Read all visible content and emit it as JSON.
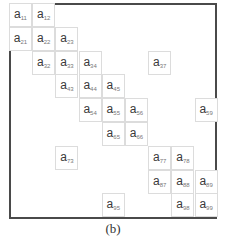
{
  "figure": {
    "caption": "(b)",
    "matrix_size": 9,
    "cell_prefix": "a",
    "frame_color": "#4a4a4a",
    "cell_border_color": "#dcdcdc"
  },
  "cells": [
    {
      "row": 1,
      "col": 1,
      "base": "a",
      "sub": "11"
    },
    {
      "row": 1,
      "col": 2,
      "base": "a",
      "sub": "12"
    },
    {
      "row": 2,
      "col": 1,
      "base": "a",
      "sub": "21"
    },
    {
      "row": 2,
      "col": 2,
      "base": "a",
      "sub": "22"
    },
    {
      "row": 2,
      "col": 3,
      "base": "a",
      "sub": "23"
    },
    {
      "row": 3,
      "col": 2,
      "base": "a",
      "sub": "32"
    },
    {
      "row": 3,
      "col": 3,
      "base": "a",
      "sub": "33"
    },
    {
      "row": 3,
      "col": 4,
      "base": "a",
      "sub": "34"
    },
    {
      "row": 3,
      "col": 7,
      "base": "a",
      "sub": "37"
    },
    {
      "row": 4,
      "col": 3,
      "base": "a",
      "sub": "43"
    },
    {
      "row": 4,
      "col": 4,
      "base": "a",
      "sub": "44"
    },
    {
      "row": 4,
      "col": 5,
      "base": "a",
      "sub": "45"
    },
    {
      "row": 5,
      "col": 4,
      "base": "a",
      "sub": "54"
    },
    {
      "row": 5,
      "col": 5,
      "base": "a",
      "sub": "55"
    },
    {
      "row": 5,
      "col": 6,
      "base": "a",
      "sub": "56"
    },
    {
      "row": 5,
      "col": 9,
      "base": "a",
      "sub": "59"
    },
    {
      "row": 6,
      "col": 5,
      "base": "a",
      "sub": "65"
    },
    {
      "row": 6,
      "col": 6,
      "base": "a",
      "sub": "66"
    },
    {
      "row": 7,
      "col": 3,
      "base": "a",
      "sub": "73"
    },
    {
      "row": 7,
      "col": 7,
      "base": "a",
      "sub": "77"
    },
    {
      "row": 7,
      "col": 8,
      "base": "a",
      "sub": "78"
    },
    {
      "row": 8,
      "col": 7,
      "base": "a",
      "sub": "87"
    },
    {
      "row": 8,
      "col": 8,
      "base": "a",
      "sub": "88"
    },
    {
      "row": 8,
      "col": 9,
      "base": "a",
      "sub": "89"
    },
    {
      "row": 9,
      "col": 5,
      "base": "a",
      "sub": "95"
    },
    {
      "row": 9,
      "col": 8,
      "base": "a",
      "sub": "98"
    },
    {
      "row": 9,
      "col": 9,
      "base": "a",
      "sub": "99"
    }
  ]
}
